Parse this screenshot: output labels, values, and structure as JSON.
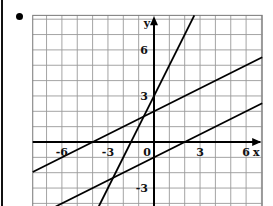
{
  "chart_data": {
    "type": "line",
    "title": "",
    "xlabel": "x",
    "ylabel": "y",
    "xlim": [
      -7.9,
      7.05
    ],
    "ylim": [
      -4.2,
      8.25
    ],
    "grid": true,
    "grid_step": 1,
    "x_ticks": [
      {
        "value": -6,
        "label": "-6"
      },
      {
        "value": -3,
        "label": "-3"
      },
      {
        "value": 0,
        "label": "0"
      },
      {
        "value": 3,
        "label": "3"
      },
      {
        "value": 6,
        "label": "6"
      }
    ],
    "y_ticks": [
      {
        "value": 6,
        "label": "6"
      },
      {
        "value": 3,
        "label": "3"
      },
      {
        "value": -3,
        "label": "-3"
      }
    ],
    "series": [
      {
        "name": "line-steep",
        "equation": "y = 2x + 3",
        "slope": 2,
        "intercept": 3
      },
      {
        "name": "line-upper",
        "equation": "y = 0.5x + 2",
        "slope": 0.5,
        "intercept": 2
      },
      {
        "name": "line-lower",
        "equation": "y = 0.5x - 1",
        "slope": 0.5,
        "intercept": -1
      }
    ]
  },
  "bullet": "•"
}
